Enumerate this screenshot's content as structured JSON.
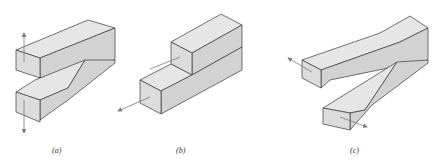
{
  "figure": {
    "panels": [
      {
        "id": "a",
        "label": "(a)",
        "description": "Opening mode: split block with two arms pulled apart vertically"
      },
      {
        "id": "b",
        "label": "(b)",
        "description": "Sliding mode: stacked blocks with in-plane shear along length"
      },
      {
        "id": "c",
        "label": "(c)",
        "description": "Tearing mode: split block with arms pulled out-of-plane"
      }
    ],
    "colors": {
      "top_face": "#e6e6e6",
      "side_face": "#d2d2d2",
      "front_face": "#dcdcdc",
      "edge": "#3a3a3a",
      "arrow": "#7a7a7a"
    }
  }
}
